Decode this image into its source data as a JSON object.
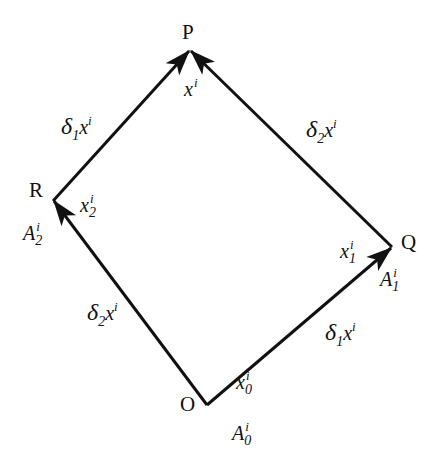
{
  "diagram": {
    "type": "parallelogram-parallel-transport",
    "stroke_color": "#111111",
    "background": "#ffffff",
    "vertices": {
      "O": {
        "label": "O",
        "coord_label": "x",
        "coord_sub": "0",
        "coord_sup": "i",
        "vector_label": "A",
        "vector_sub": "0",
        "vector_sup": "i"
      },
      "Q": {
        "label": "Q",
        "coord_label": "x",
        "coord_sub": "1",
        "coord_sup": "i",
        "vector_label": "A",
        "vector_sub": "1",
        "vector_sup": "i"
      },
      "R": {
        "label": "R",
        "coord_label": "x",
        "coord_sub": "2",
        "coord_sup": "i",
        "vector_label": "A",
        "vector_sub": "2",
        "vector_sup": "i"
      },
      "P": {
        "label": "P",
        "coord_label": "x",
        "coord_sup": "i"
      }
    },
    "edges": [
      {
        "from": "O",
        "to": "Q",
        "label_delta": "δ",
        "label_sub": "1",
        "label_var": "x",
        "label_sup": "i"
      },
      {
        "from": "Q",
        "to": "P",
        "label_delta": "δ",
        "label_sub": "2",
        "label_var": "x",
        "label_sup": "i"
      },
      {
        "from": "O",
        "to": "R",
        "label_delta": "δ",
        "label_sub": "2",
        "label_var": "x",
        "label_sup": "i"
      },
      {
        "from": "R",
        "to": "P",
        "label_delta": "δ",
        "label_sub": "1",
        "label_var": "x",
        "label_sup": "i"
      }
    ]
  }
}
